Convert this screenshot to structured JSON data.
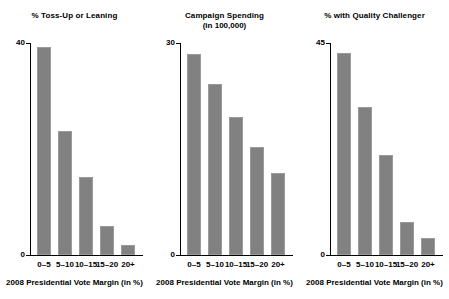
{
  "figure": {
    "background": "#ffffff",
    "bar_color": "#818181",
    "bar_edge_color": "#9a9a9a",
    "axis_color": "#000000"
  },
  "chart_data": [
    {
      "type": "bar",
      "title": "% Toss-Up or Leaning",
      "subtitle": "",
      "xlabel": "2008 Presidential Vote Margin (in %)",
      "ylabel": "",
      "categories": [
        "0–5",
        "5–10",
        "10–15",
        "15–20",
        "20+"
      ],
      "values": [
        39.3,
        23.4,
        14.7,
        5.5,
        1.9
      ],
      "ylim": [
        0,
        40
      ],
      "yticks": [
        "0",
        "40"
      ],
      "ytick_values": [
        0,
        40
      ],
      "grid": false,
      "legend": "none"
    },
    {
      "type": "bar",
      "title": "Campaign Spending",
      "subtitle": "(in 100,000)",
      "xlabel": "2008 Presidential Vote Margin (in %)",
      "ylabel": "",
      "categories": [
        "0–5",
        "5–10",
        "10–15",
        "15–20",
        "20+"
      ],
      "values": [
        28.4,
        24.2,
        19.5,
        15.3,
        11.6
      ],
      "ylim": [
        0,
        30
      ],
      "yticks": [
        "0",
        "30"
      ],
      "ytick_values": [
        0,
        30
      ],
      "grid": false,
      "legend": "none"
    },
    {
      "type": "bar",
      "title": "% with Quality Challenger",
      "subtitle": "",
      "xlabel": "2008 Presidential Vote Margin (in %)",
      "ylabel": "",
      "categories": [
        "0–5",
        "5–10",
        "10–15",
        "15–20",
        "20+"
      ],
      "values": [
        42.9,
        31.4,
        21.2,
        7.0,
        3.6
      ],
      "ylim": [
        0,
        45
      ],
      "yticks": [
        "0",
        "45"
      ],
      "ytick_values": [
        0,
        45
      ],
      "grid": false,
      "legend": "none"
    }
  ]
}
